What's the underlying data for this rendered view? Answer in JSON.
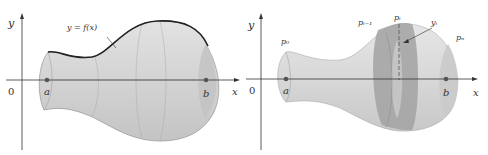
{
  "figures": [
    {
      "id": "left",
      "axis_x_label": "x",
      "axis_y_label": "y",
      "origin_label": "0",
      "point_a_label": "a",
      "point_b_label": "b",
      "curve_label": "y = f(x)"
    },
    {
      "id": "right",
      "axis_x_label": "x",
      "axis_y_label": "y",
      "origin_label": "0",
      "point_a_label": "a",
      "point_b_label": "b",
      "p0_label": "p₀",
      "pim1_label": "pᵢ₋₁",
      "pi_label": "pᵢ",
      "pn_label": "pₙ",
      "yi_label": "yᵢ"
    }
  ],
  "colors": {
    "solid_fill": "#d6d6d6",
    "solid_dark": "#a9a9a9",
    "band_fill": "#9e9e9e",
    "outline": "#222222",
    "axis": "#333333",
    "point": "#555555"
  }
}
